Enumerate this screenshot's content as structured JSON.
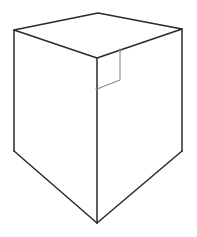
{
  "diagram": {
    "type": "3D prism (square top, pointed bottom) with right-angle marker",
    "colors": {
      "background": "#ffffff",
      "edge": "#2a2a2a",
      "marker": "#7a7a7a"
    },
    "vertices": {
      "top_back": [
        98,
        13
      ],
      "top_left": [
        14,
        30
      ],
      "top_right": [
        182,
        29
      ],
      "top_front": [
        97,
        58
      ],
      "bottom_left": [
        14,
        151
      ],
      "bottom_right": [
        182,
        151
      ],
      "bottom_point": [
        97,
        223
      ]
    },
    "right_angle_marker": [
      [
        97,
        58
      ],
      [
        120,
        50
      ],
      [
        120,
        80
      ],
      [
        97,
        89
      ]
    ]
  }
}
